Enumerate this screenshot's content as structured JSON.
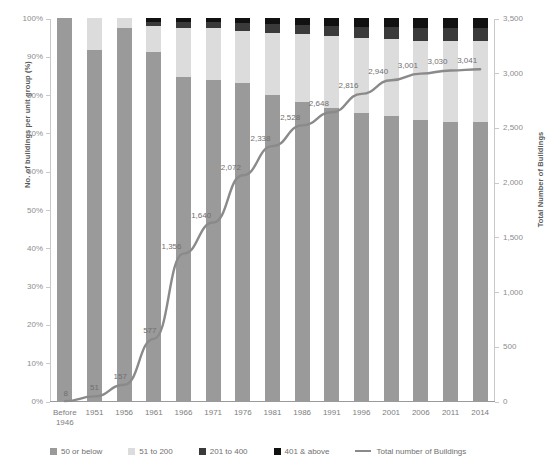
{
  "chart_data": {
    "type": "bar",
    "title": "",
    "xlabel": "",
    "ylabel": "No. of buildings per unit group (%)",
    "y2label": "Total Number of Buildings",
    "ylim": [
      0,
      100
    ],
    "y2lim": [
      0,
      3500
    ],
    "grid": false,
    "legend_position": "bottom",
    "categories": [
      "Before\n1946",
      "1951",
      "1956",
      "1961",
      "1966",
      "1971",
      "1976",
      "1981",
      "1986",
      "1991",
      "1996",
      "2001",
      "2006",
      "2011",
      "2014"
    ],
    "y_ticks": [
      "0%",
      "10%",
      "20%",
      "30%",
      "40%",
      "50%",
      "60%",
      "70%",
      "80%",
      "90%",
      "100%"
    ],
    "y2_ticks": [
      "0",
      "500",
      "1,000",
      "1,500",
      "2,000",
      "2,500",
      "3,000",
      "3,500"
    ],
    "series": [
      {
        "name": "50 or below",
        "type": "bar",
        "color": "#9a9a9a",
        "values": [
          100.0,
          91.7,
          97.5,
          91.2,
          84.5,
          83.7,
          83.1,
          79.8,
          78.0,
          76.5,
          75.3,
          74.3,
          73.5,
          72.9,
          72.8
        ]
      },
      {
        "name": "51 to 200",
        "type": "bar",
        "color": "#dcdcdc",
        "values": [
          0.0,
          8.3,
          2.5,
          6.8,
          13.0,
          13.6,
          13.6,
          16.4,
          17.7,
          18.9,
          19.5,
          20.3,
          20.6,
          21.0,
          21.2
        ]
      },
      {
        "name": "201 to 400",
        "type": "bar",
        "color": "#3a3a3a",
        "values": [
          0.0,
          0.0,
          0.0,
          1.0,
          1.4,
          1.6,
          2.0,
          2.3,
          2.5,
          2.6,
          2.9,
          3.1,
          3.3,
          3.4,
          3.4
        ]
      },
      {
        "name": "401 & above",
        "type": "bar",
        "color": "#111111",
        "values": [
          0.0,
          0.0,
          0.0,
          1.0,
          1.1,
          1.1,
          1.3,
          1.5,
          1.8,
          2.0,
          2.3,
          2.3,
          2.6,
          2.7,
          2.6
        ]
      },
      {
        "name": "Total number of Buildings",
        "type": "line",
        "color": "#8a8a8a",
        "axis": "right",
        "values": [
          8,
          51,
          157,
          577,
          1356,
          1640,
          2072,
          2338,
          2528,
          2648,
          2816,
          2940,
          3001,
          3030,
          3041
        ],
        "labels": [
          "8",
          "51",
          "157",
          "577",
          "1,356",
          "1,640",
          "2,072",
          "2,338",
          "2,528",
          "2,648",
          "2,816",
          "2,940",
          "3,001",
          "3,030",
          "3,041"
        ]
      }
    ]
  },
  "legend": {
    "items": [
      {
        "label": "50 or below",
        "color": "#9a9a9a",
        "marker": "square"
      },
      {
        "label": "51 to 200",
        "color": "#dcdcdc",
        "marker": "square"
      },
      {
        "label": "201 to 400",
        "color": "#3a3a3a",
        "marker": "square"
      },
      {
        "label": "401 & above",
        "color": "#111111",
        "marker": "square"
      },
      {
        "label": "Total number of Buildings",
        "color": "#8a8a8a",
        "marker": "line"
      }
    ]
  }
}
